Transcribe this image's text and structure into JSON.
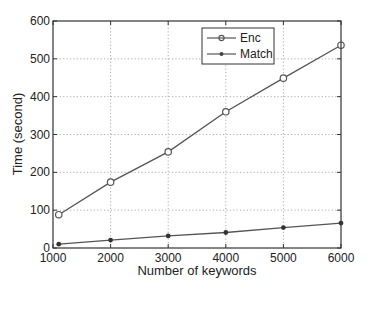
{
  "chart_data": {
    "type": "line",
    "title": "",
    "xlabel": "Number of keywords",
    "ylabel": "Time (second)",
    "x": [
      1100,
      2000,
      3000,
      4000,
      5000,
      6000
    ],
    "xlim": [
      1000,
      6000
    ],
    "ylim": [
      0,
      600
    ],
    "xticks": [
      1000,
      2000,
      3000,
      4000,
      5000,
      6000
    ],
    "yticks": [
      0,
      100,
      200,
      300,
      400,
      500,
      600
    ],
    "grid": true,
    "legend_position": "upper right (inset)",
    "series": [
      {
        "name": "Enc",
        "marker": "circle",
        "values": [
          88,
          174,
          254,
          360,
          449,
          536
        ]
      },
      {
        "name": "Match",
        "marker": "asterisk",
        "values": [
          10,
          21,
          32,
          41,
          54,
          66
        ]
      }
    ]
  },
  "colors": {
    "line": "#555555",
    "axis": "#333333",
    "grid": "#999999"
  }
}
